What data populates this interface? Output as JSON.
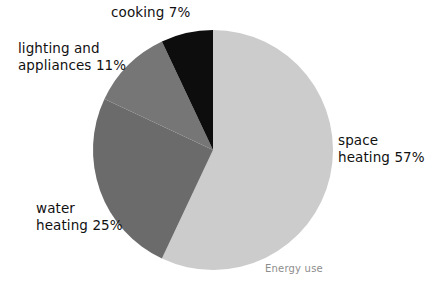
{
  "chart_data": {
    "type": "pie",
    "title": "",
    "caption": "Energy use",
    "legend_position": "outside-labels",
    "total": 100,
    "units": "%",
    "start_angle_deg": 0,
    "direction": "clockwise",
    "categories": [
      "space heating",
      "water heating",
      "lighting and appliances",
      "cooking"
    ],
    "values": [
      57,
      25,
      11,
      7
    ],
    "slices": [
      {
        "name": "space heating",
        "value": 57,
        "value_label": "57%",
        "label_lines": [
          "space",
          "heating 57%"
        ],
        "color": "#cccccc",
        "start_deg": 0,
        "end_deg": 205.2
      },
      {
        "name": "water heating",
        "value": 25,
        "value_label": "25%",
        "label_lines": [
          "water",
          "heating 25%"
        ],
        "color": "#6b6b6b",
        "start_deg": 205.2,
        "end_deg": 295.2
      },
      {
        "name": "lighting and appliances",
        "value": 11,
        "value_label": "11%",
        "label_lines": [
          "lighting and",
          "appliances 11%"
        ],
        "color": "#767676",
        "start_deg": 295.2,
        "end_deg": 334.8
      },
      {
        "name": "cooking",
        "value": 7,
        "value_label": "7%",
        "label_lines": [
          "cooking 7%"
        ],
        "color": "#0d0d0d",
        "start_deg": 334.8,
        "end_deg": 360
      }
    ],
    "xlabel": "",
    "ylabel": "",
    "grid": false
  },
  "geometry": {
    "center_x": 213,
    "center_y": 150,
    "radius": 120
  },
  "colors": {
    "background": "#ffffff",
    "space_heating": "#cccccc",
    "water_heating": "#6b6b6b",
    "lighting_appliances": "#767676",
    "cooking": "#0d0d0d",
    "label_text": "#111111",
    "caption_text": "#8d8d8d"
  }
}
